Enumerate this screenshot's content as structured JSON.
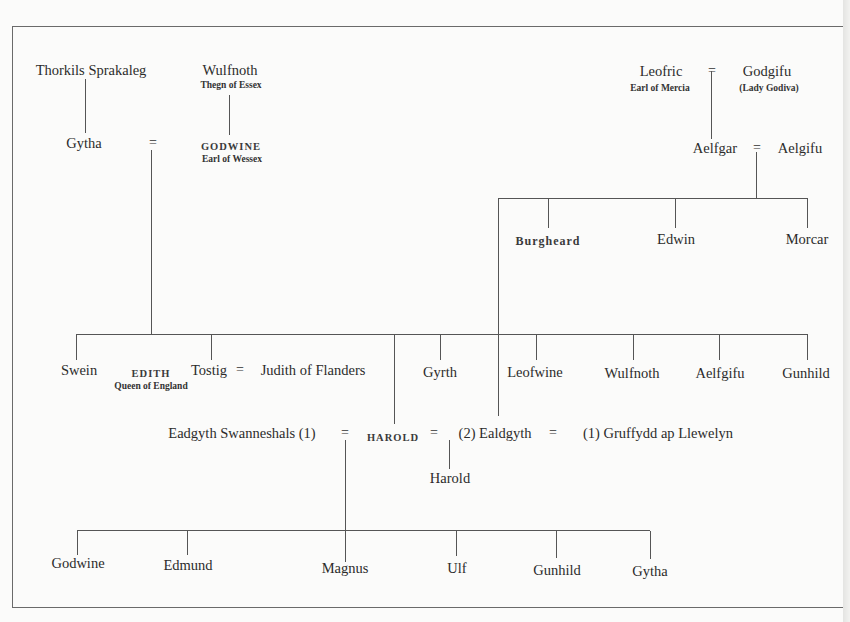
{
  "diagram": {
    "type": "genealogy",
    "generation_1": {
      "thorkils": {
        "name": "Thorkils Sprakaleg"
      },
      "wulfnoth_elder": {
        "name": "Wulfnoth",
        "title": "Thegn of Essex"
      },
      "leofric": {
        "name": "Leofric",
        "title": "Earl of Mercia"
      },
      "godgifu": {
        "name": "Godgifu",
        "title": "(Lady Godiva)"
      }
    },
    "generation_2": {
      "gytha": {
        "name": "Gytha"
      },
      "godwine": {
        "name": "GODWINE",
        "title": "Earl of Wessex"
      },
      "aelfgar": {
        "name": "Aelfgar"
      },
      "aelgifu": {
        "name": "Aelgifu"
      }
    },
    "aelfgar_children": [
      {
        "name": "Burgheard",
        "smallcaps": true
      },
      {
        "name": "Edwin"
      },
      {
        "name": "Morcar"
      }
    ],
    "godwine_children": [
      {
        "name": "Swein"
      },
      {
        "name": "EDITH",
        "title": "Queen of England",
        "smallcaps": true
      },
      {
        "name": "Tostig"
      },
      {
        "name": "Gyrth"
      },
      {
        "name": "Leofwine"
      },
      {
        "name": "Wulfnoth"
      },
      {
        "name": "Aelfgifu"
      },
      {
        "name": "Gunhild"
      }
    ],
    "tostig_spouse": {
      "name": "Judith of Flanders"
    },
    "harold_row": {
      "wife1": "Eadgyth Swanneshals (1)",
      "harold": "HAROLD",
      "wife2": "(2) Ealdgyth",
      "ealdgyth_husband1": "(1) Gruffydd ap Llewelyn"
    },
    "harold_ealdgyth_child": {
      "name": "Harold"
    },
    "harold_eadgyth_children": [
      {
        "name": "Godwine"
      },
      {
        "name": "Edmund"
      },
      {
        "name": "Magnus"
      },
      {
        "name": "Ulf"
      },
      {
        "name": "Gunhild"
      },
      {
        "name": "Gytha"
      }
    ],
    "marriage_symbol": "="
  }
}
